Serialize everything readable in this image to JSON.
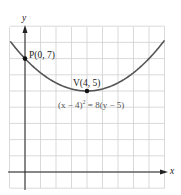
{
  "chart_data": {
    "type": "line",
    "title": "",
    "xlabel": "x",
    "ylabel": "y",
    "equation": "(x − 4)² = 8(y − 5)",
    "xlim": [
      -1,
      9
    ],
    "ylim": [
      -1,
      9
    ],
    "grid": true,
    "series": [
      {
        "name": "parabola",
        "equation": "(x - 4)^2 = 8(y - 5)",
        "x": [
          -1,
          0,
          1,
          2,
          3,
          4,
          5,
          6,
          7,
          8,
          9
        ],
        "y": [
          8.125,
          7,
          6.125,
          5.5,
          5.125,
          5,
          5.125,
          5.5,
          6.125,
          7,
          8.125
        ]
      }
    ],
    "points": [
      {
        "label": "P(0, 7)",
        "x": 0,
        "y": 7
      },
      {
        "label": "V(4, 5)",
        "x": 4,
        "y": 5
      }
    ],
    "colors": {
      "curve": "#555555",
      "grid": "#cfcfcf",
      "axis": "#222222"
    }
  },
  "labels": {
    "x_axis": "x",
    "y_axis": "y",
    "point_p": "P(0, 7)",
    "point_v": "V(4, 5)",
    "equation_prefix": "(x − 4)",
    "equation_sup": "2",
    "equation_suffix": " = 8(y − 5)"
  }
}
